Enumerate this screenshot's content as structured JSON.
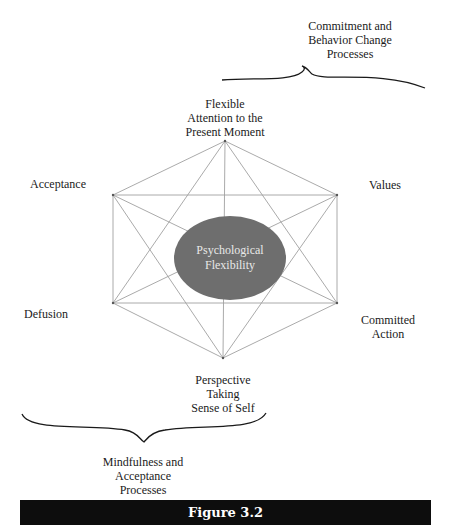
{
  "figure": {
    "caption": "Figure 3.2",
    "center_label": [
      "Psychological",
      "Flexibility"
    ],
    "nodes": {
      "top": [
        "Flexible",
        "Attention to the",
        "Present Moment"
      ],
      "upper_left": [
        "Acceptance"
      ],
      "upper_right": [
        "Values"
      ],
      "lower_left": [
        "Defusion"
      ],
      "lower_right": [
        "Committed",
        "Action"
      ],
      "bottom": [
        "Perspective",
        "Taking",
        "Sense of Self"
      ]
    },
    "groups": {
      "commitment": [
        "Commitment and",
        "Behavior Change",
        "Processes"
      ],
      "mindfulness": [
        "Mindfulness and",
        "Acceptance",
        "Processes"
      ]
    },
    "colors": {
      "ellipse_fill": "#6e6e6e",
      "line": "#9a9a9a",
      "caption_bar": "#0d0d0d"
    }
  }
}
